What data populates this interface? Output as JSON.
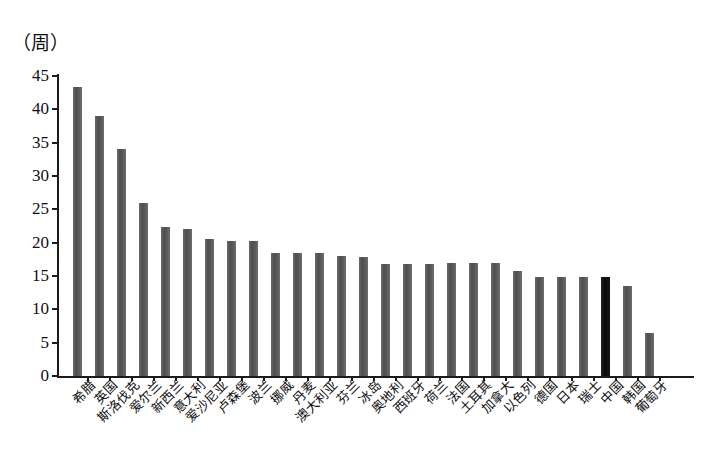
{
  "chart_data": {
    "type": "bar",
    "title": "",
    "subtitle": "",
    "unit_label": "（周）",
    "xlabel": "",
    "ylabel": "",
    "ylim": [
      0,
      45
    ],
    "yticks": [
      0,
      5,
      10,
      15,
      20,
      25,
      30,
      35,
      40,
      45
    ],
    "ytick_labels": [
      "0",
      "5",
      "10",
      "15",
      "20",
      "25",
      "30",
      "35",
      "40",
      "45"
    ],
    "grid": false,
    "legend": null,
    "bar_color": "#565656",
    "highlight_color": "#141414",
    "highlight_category": "中国",
    "categories": [
      "希腊",
      "英国",
      "斯洛伐克",
      "爱尔兰",
      "新西兰",
      "意大利",
      "爱沙尼亚",
      "卢森堡",
      "波兰",
      "挪威",
      "丹麦",
      "澳大利亚",
      "芬兰",
      "冰岛",
      "奥地利",
      "西班牙",
      "荷兰",
      "法国",
      "土耳其",
      "加拿大",
      "以色列",
      "德国",
      "日本",
      "瑞士",
      "中国",
      "韩国",
      "葡萄牙"
    ],
    "values": [
      43.3,
      39.0,
      34.0,
      26.0,
      22.3,
      22.0,
      20.5,
      20.3,
      20.2,
      18.5,
      18.4,
      18.4,
      18.0,
      17.8,
      16.8,
      16.8,
      16.8,
      16.9,
      16.9,
      17.0,
      15.7,
      14.9,
      14.8,
      14.9,
      14.9,
      13.5,
      6.5
    ]
  }
}
